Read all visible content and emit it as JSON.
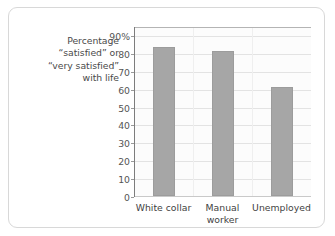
{
  "chart_data": {
    "type": "bar",
    "title": "",
    "subtitle": "",
    "xlabel": "",
    "ylabel": "Percentage “satisfied” or “very satisfied” with life",
    "ylabel_lines": [
      "Percentage",
      "“satisfied” or",
      "“very satisfied”",
      "with life"
    ],
    "categories": [
      "White collar",
      "Manual worker",
      "Unemployed"
    ],
    "category_lines": [
      [
        "White collar"
      ],
      [
        "Manual",
        "worker"
      ],
      [
        "Unemployed"
      ]
    ],
    "values": [
      83,
      81,
      61
    ],
    "ylim": [
      0,
      95
    ],
    "yticks": [
      0,
      10,
      20,
      30,
      40,
      50,
      60,
      70,
      80,
      90
    ],
    "yticklabels": [
      "0",
      "10",
      "20",
      "30",
      "40",
      "50",
      "60",
      "70",
      "80",
      "90%"
    ],
    "grid": true,
    "grid_axis": "y",
    "legend": null,
    "colors": {
      "bar_fill": "#a6a6a6",
      "bar_edge": "#9c9c9c",
      "gridline": "#e3e3e3",
      "axis": "#7d7d7d",
      "plot_background": "#fcfcfc",
      "frame_border": "#d8d8d8",
      "tick_text": "#555555",
      "label_text": "#4a4a4a"
    }
  }
}
